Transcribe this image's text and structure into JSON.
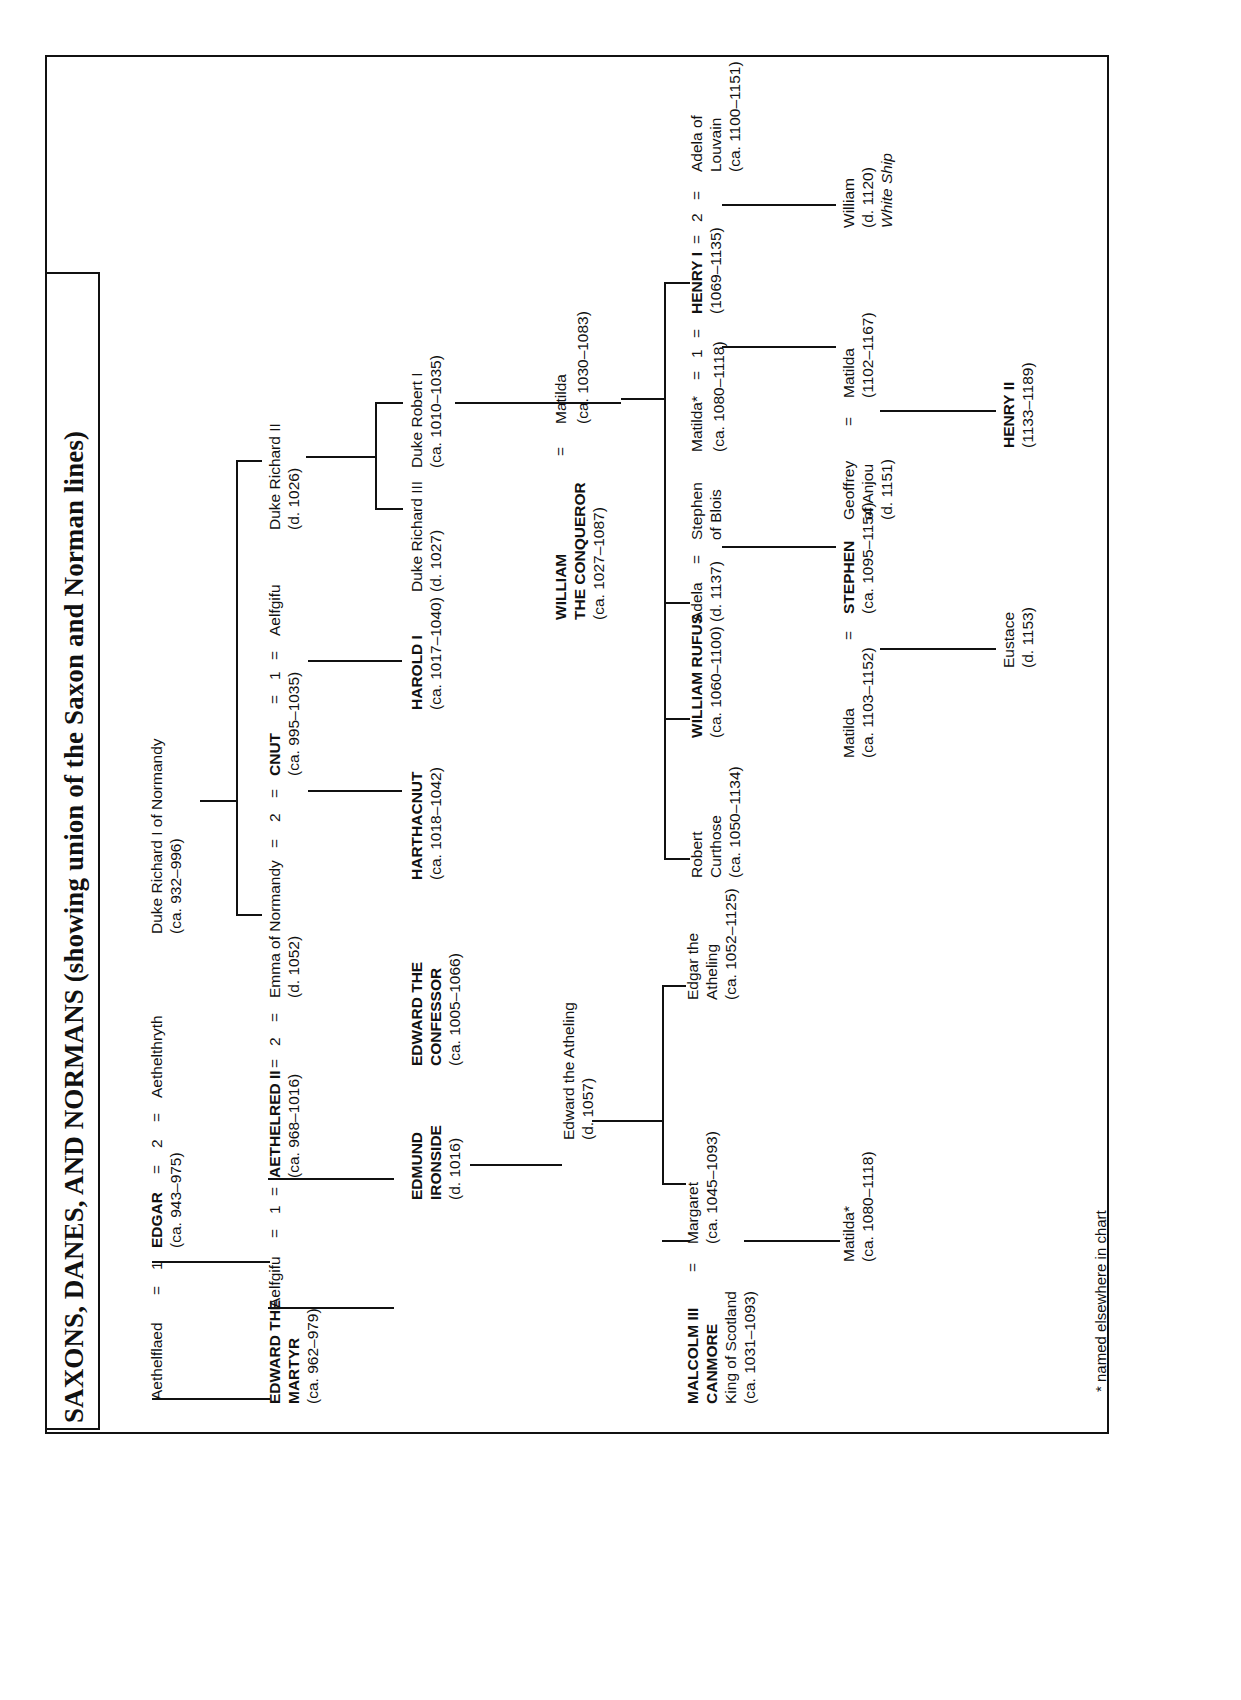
{
  "title": "SAXONS, DANES, AND NORMANS (showing union of the Saxon and Norman lines)",
  "footnote": "* named elsewhere in chart",
  "people": {
    "aethelflaed": {
      "name": "Aethelflaed"
    },
    "eq1a": {
      "name": "="
    },
    "one_a": {
      "name": "1"
    },
    "edgar": {
      "name": "EDGAR",
      "dates": "(ca. 943–975)"
    },
    "eq2a": {
      "name": "="
    },
    "two_a": {
      "name": "2"
    },
    "eq3a": {
      "name": "="
    },
    "aethelthryth": {
      "name": "Aethelthryth"
    },
    "duke_richard_i": {
      "name": "Duke Richard I of Normandy",
      "dates": "(ca. 932–996)"
    },
    "edward_martyr": {
      "name_l1": "EDWARD THE",
      "name_l2": "MARTYR",
      "dates": "(ca. 962–979)"
    },
    "aelfgifu_1": {
      "name": "Aelfgifu"
    },
    "eq_b1": {
      "name": "="
    },
    "one_b": {
      "name": "1"
    },
    "eq_b2": {
      "name": "="
    },
    "aethelred_ii": {
      "name": "AETHELRED II",
      "dates": "(ca. 968–1016)"
    },
    "eq_b3": {
      "name": "="
    },
    "two_b": {
      "name": "2"
    },
    "eq_b4": {
      "name": "="
    },
    "emma": {
      "name": "Emma of Normandy",
      "dates": "(d. 1052)"
    },
    "eq_c1": {
      "name": "="
    },
    "two_c": {
      "name": "2"
    },
    "eq_c2": {
      "name": "="
    },
    "cnut": {
      "name": "CNUT",
      "dates": "(ca. 995–1035)"
    },
    "eq_c3": {
      "name": "="
    },
    "one_c": {
      "name": "1"
    },
    "eq_c4": {
      "name": "="
    },
    "aelfgifu_2": {
      "name": "Aelfgifu"
    },
    "duke_richard_ii": {
      "name": "Duke Richard II",
      "dates": "(d. 1026)"
    },
    "duke_richard_iii": {
      "name": "Duke Richard III",
      "dates": "(d. 1027)"
    },
    "duke_robert_i": {
      "name": "Duke Robert I",
      "dates": "(ca. 1010–1035)"
    },
    "edmund_ironside": {
      "name_l1": "EDMUND",
      "name_l2": "IRONSIDE",
      "dates": "(d. 1016)"
    },
    "edward_confessor": {
      "name_l1": "EDWARD THE",
      "name_l2": "CONFESSOR",
      "dates": "(ca. 1005–1066)"
    },
    "harthacnut": {
      "name": "HARTHACNUT",
      "dates": "(ca. 1018–1042)"
    },
    "harold_i": {
      "name": "HAROLD I",
      "dates": "(ca. 1017–1040)"
    },
    "edward_atheling": {
      "name": "Edward the Atheling",
      "dates": "(d. 1057)"
    },
    "william_conqueror": {
      "name_l1": "WILLIAM",
      "name_l2": "THE CONQUEROR",
      "dates": "(ca. 1027–1087)"
    },
    "eq_w": {
      "name": "="
    },
    "matilda_w": {
      "name": "Matilda",
      "dates": "(ca. 1030–1083)"
    },
    "edgar_atheling": {
      "name_l1": "Edgar the",
      "name_l2": "Atheling",
      "dates": "(ca. 1052–1125)"
    },
    "margaret": {
      "name": "Margaret",
      "dates": "(ca. 1045–1093)"
    },
    "eq_m": {
      "name": "="
    },
    "malcolm_iii": {
      "name_l1": "MALCOLM III",
      "name_l2": "CANMORE",
      "name_l3": "King of Scotland",
      "dates": "(ca. 1031–1093)"
    },
    "matilda_scot": {
      "name": "Matilda*",
      "dates": "(ca. 1080–1118)"
    },
    "robert_curthose": {
      "name_l1": "Robert",
      "name_l2": "Curthose",
      "dates": "(ca. 1050–1134)"
    },
    "william_rufus": {
      "name": "WILLIAM RUFUS",
      "dates": "(ca. 1060–1100)"
    },
    "adela": {
      "name": "Adela",
      "dates": "(d. 1137)"
    },
    "eq_adela": {
      "name": "="
    },
    "stephen_blois": {
      "name_l1": "Stephen",
      "name_l2": "of Blois"
    },
    "matilda_star": {
      "name": "Matilda*",
      "dates": "(ca. 1080–1118)"
    },
    "eq_h1": {
      "name": "="
    },
    "one_h": {
      "name": "1"
    },
    "eq_h2": {
      "name": "="
    },
    "henry_i": {
      "name": "HENRY I",
      "dates": "(1069–1135)"
    },
    "eq_h3": {
      "name": "="
    },
    "two_h": {
      "name": "2"
    },
    "eq_h4": {
      "name": "="
    },
    "adela_louvain": {
      "name_l1": "Adela of",
      "name_l2": "Louvain",
      "dates": "(ca. 1100–1151)"
    },
    "william_whiteship": {
      "name_l1": "William",
      "name_l2": "(d. 1120)",
      "name_l3": "White Ship"
    },
    "matilda_1102": {
      "name": "Matilda",
      "dates": "(1102–1167)"
    },
    "geoffrey_anjou": {
      "name_l1": "Geoffrey",
      "name_l2": "of Anjou",
      "name_l3": "(d. 1151)"
    },
    "eq_g": {
      "name": "="
    },
    "matilda_1103": {
      "name": "Matilda",
      "dates": "(ca. 1103–1152)"
    },
    "eq_s": {
      "name": "="
    },
    "stephen_king": {
      "name": "STEPHEN",
      "dates": "(ca. 1095–1154)"
    },
    "eustace": {
      "name": "Eustace",
      "dates": "(d. 1153)"
    },
    "henry_ii": {
      "name": "HENRY II",
      "dates": "(1133–1189)"
    }
  }
}
